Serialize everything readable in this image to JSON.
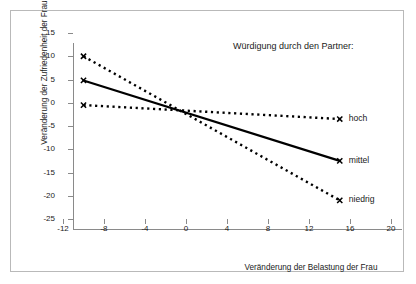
{
  "chart_data": {
    "type": "line",
    "title": "",
    "legend_title": "Würdigung durch den Partner:",
    "legend_position": "right-of-line-ends",
    "xlabel": "Veränderung der Belastung der Frau",
    "ylabel": "Veränderung der Zufriedenheit der Frau",
    "xlim": [
      -12,
      20
    ],
    "ylim": [
      -25,
      15
    ],
    "xticks": [
      -12,
      -8,
      -4,
      0,
      4,
      8,
      12,
      16,
      20
    ],
    "xtick_labels": [
      "-12",
      "-8",
      "-4",
      "0",
      "4",
      "8",
      "12",
      "16",
      "20"
    ],
    "yticks": [
      15,
      10,
      5,
      0,
      -5,
      -10,
      -15,
      -20,
      -25
    ],
    "ytick_labels": [
      "15",
      "10",
      "5",
      "0",
      "-5",
      "-10",
      "-15",
      "-20",
      "-25"
    ],
    "grid": false,
    "marker": "x",
    "x": [
      -10,
      15
    ],
    "series": [
      {
        "name": "niedrig",
        "label": "niedrig",
        "style": "dotted",
        "color": "#000000",
        "values": [
          10,
          -21
        ]
      },
      {
        "name": "mittel",
        "label": "mittel",
        "style": "solid",
        "color": "#000000",
        "values": [
          4.8,
          -12.5
        ]
      },
      {
        "name": "hoch",
        "label": "hoch",
        "style": "dotted",
        "color": "#000000",
        "values": [
          -0.5,
          -3.5
        ]
      }
    ]
  },
  "colors": {
    "axis": "#8a8a8a",
    "frame": "#b9b9b9",
    "ink": "#000000",
    "background": "#ffffff"
  }
}
